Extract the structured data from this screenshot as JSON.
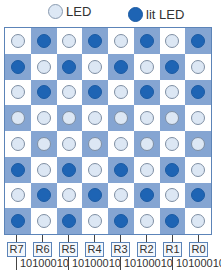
{
  "legend": {
    "off_label": "LED",
    "on_label": "lit LED"
  },
  "colors": {
    "led_on": "#1e64b4",
    "led_off": "#dce7f4",
    "cell_dark": "#85a5d2",
    "cell_light": "#ffffff"
  },
  "grid": {
    "rows": [
      [
        0,
        1,
        0,
        1,
        0,
        1,
        0,
        1
      ],
      [
        1,
        0,
        1,
        0,
        1,
        0,
        1,
        0
      ],
      [
        0,
        1,
        0,
        1,
        0,
        1,
        0,
        1
      ],
      [
        0,
        0,
        0,
        0,
        0,
        0,
        0,
        0
      ],
      [
        0,
        0,
        0,
        0,
        0,
        0,
        0,
        0
      ],
      [
        1,
        0,
        1,
        0,
        1,
        0,
        1,
        0
      ],
      [
        0,
        1,
        0,
        1,
        0,
        1,
        0,
        1
      ],
      [
        1,
        0,
        1,
        0,
        1,
        0,
        1,
        0
      ]
    ]
  },
  "column_labels": [
    "R7",
    "R6",
    "R5",
    "R4",
    "R3",
    "R2",
    "R1",
    "R0"
  ],
  "bit_strings": [
    "10100010",
    "10100010",
    "10100010",
    "10100010"
  ]
}
